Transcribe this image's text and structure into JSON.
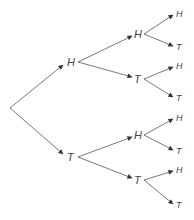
{
  "diagram": {
    "type": "probability-tree",
    "colors": {
      "line": "#555555",
      "text": "#444444",
      "background": "#ffffff"
    },
    "root": {
      "x": 10,
      "y": 108
    },
    "level1": [
      {
        "label": "H",
        "x": 69,
        "y": 62,
        "tx": 72,
        "ty": 66
      },
      {
        "label": "T",
        "x": 69,
        "y": 157,
        "tx": 72,
        "ty": 161
      }
    ],
    "level2": [
      {
        "label": "H",
        "x": 140,
        "y": 34,
        "tx": 133,
        "ty": 38,
        "parent": 0
      },
      {
        "label": "T",
        "x": 140,
        "y": 79,
        "tx": 133,
        "ty": 83,
        "parent": 0
      },
      {
        "label": "H",
        "x": 140,
        "y": 135,
        "tx": 133,
        "ty": 139,
        "parent": 1
      },
      {
        "label": "T",
        "x": 140,
        "y": 180,
        "tx": 133,
        "ty": 184,
        "parent": 1
      }
    ],
    "level3": [
      {
        "label": "H",
        "x": 176,
        "y": 14,
        "parent": 0
      },
      {
        "label": "T",
        "x": 176,
        "y": 47,
        "parent": 0
      },
      {
        "label": "H",
        "x": 176,
        "y": 66,
        "parent": 1
      },
      {
        "label": "T",
        "x": 176,
        "y": 98,
        "parent": 1
      },
      {
        "label": "H",
        "x": 176,
        "y": 118,
        "parent": 2
      },
      {
        "label": "T",
        "x": 176,
        "y": 151,
        "parent": 2
      },
      {
        "label": "H",
        "x": 176,
        "y": 170,
        "parent": 3
      },
      {
        "label": "T",
        "x": 176,
        "y": 205,
        "parent": 3
      }
    ]
  }
}
